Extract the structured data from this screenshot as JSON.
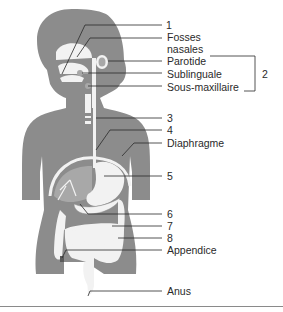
{
  "diagram": {
    "colors": {
      "body": "#8c8c8c",
      "organ_light": "#f2f2f2",
      "organ_mid": "#a8a8a8",
      "line": "#2a2a2a",
      "separator": "#8a8a8a"
    },
    "labels": [
      {
        "id": "1",
        "text": "1"
      },
      {
        "id": "fosses",
        "text": "Fosses"
      },
      {
        "id": "nasales",
        "text": "nasales"
      },
      {
        "id": "parotide",
        "text": "Parotide"
      },
      {
        "id": "sublinguale",
        "text": "Sublinguale"
      },
      {
        "id": "sous-maxillaire",
        "text": "Sous-maxillaire"
      },
      {
        "id": "2",
        "text": "2"
      },
      {
        "id": "3",
        "text": "3"
      },
      {
        "id": "4",
        "text": "4"
      },
      {
        "id": "diaphragme",
        "text": "Diaphragme"
      },
      {
        "id": "5",
        "text": "5"
      },
      {
        "id": "6",
        "text": "6"
      },
      {
        "id": "7",
        "text": "7"
      },
      {
        "id": "8",
        "text": "8"
      },
      {
        "id": "appendice",
        "text": "Appendice"
      },
      {
        "id": "anus",
        "text": "Anus"
      }
    ]
  }
}
